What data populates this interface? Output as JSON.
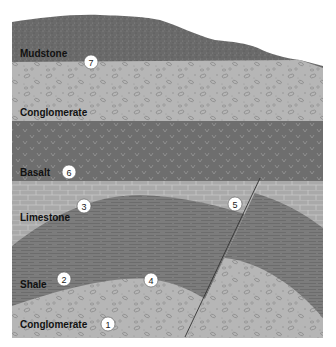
{
  "diagram": {
    "type": "geologic cross-section",
    "colors": {
      "mudstone": "#6a6a6a",
      "conglomerate": "#b4b4b4",
      "basalt": "#6e6e6e",
      "limestone": "#a9a9a9",
      "shale": "#7c7c7c",
      "fault": "#333333",
      "background": "#ffffff"
    },
    "layers": [
      {
        "name": "Mudstone",
        "marker": "7"
      },
      {
        "name": "Conglomerate",
        "marker": ""
      },
      {
        "name": "Basalt",
        "marker": "6"
      },
      {
        "name": "Limestone",
        "marker": "3"
      },
      {
        "name": "Shale",
        "marker": "2"
      },
      {
        "name": "Conglomerate",
        "marker": "1"
      }
    ],
    "markers": [
      {
        "id": "1",
        "label": "1"
      },
      {
        "id": "2",
        "label": "2"
      },
      {
        "id": "3",
        "label": "3"
      },
      {
        "id": "4",
        "label": "4"
      },
      {
        "id": "5",
        "label": "5"
      },
      {
        "id": "6",
        "label": "6"
      },
      {
        "id": "7",
        "label": "7"
      }
    ],
    "features": {
      "fault": "Fault line crossing limestone, shale and lower conglomerate"
    }
  }
}
